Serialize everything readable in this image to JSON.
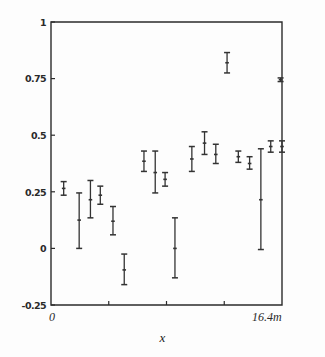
{
  "chart_data": {
    "type": "scatter",
    "title": "",
    "subtitle": "",
    "xlabel": "x",
    "ylabel": "",
    "grid": false,
    "legend": "none",
    "error_bars": "vertical",
    "xlim": [
      0,
      16.4
    ],
    "ylim": [
      -0.25,
      1.0
    ],
    "x_unit": "m",
    "xticks": [
      0,
      4.1,
      8.2,
      12.3,
      16.4
    ],
    "xtick_labels": [
      "0",
      "",
      "",
      "",
      "16.4m"
    ],
    "yticks": [
      -0.25,
      0,
      0.25,
      0.5,
      0.75,
      1
    ],
    "ytick_labels": [
      "-0.25",
      "0",
      "0.25",
      "0.5",
      "0.75",
      "1"
    ],
    "points": [
      {
        "x": 0.9,
        "y": 0.265,
        "yerr_low": 0.03,
        "yerr_high": 0.03
      },
      {
        "x": 2.0,
        "y": 0.125,
        "yerr_low": 0.125,
        "yerr_high": 0.12
      },
      {
        "x": 2.8,
        "y": 0.215,
        "yerr_low": 0.08,
        "yerr_high": 0.085
      },
      {
        "x": 3.5,
        "y": 0.235,
        "yerr_low": 0.04,
        "yerr_high": 0.04
      },
      {
        "x": 4.4,
        "y": 0.12,
        "yerr_low": 0.06,
        "yerr_high": 0.065
      },
      {
        "x": 5.2,
        "y": -0.095,
        "yerr_low": 0.065,
        "yerr_high": 0.07
      },
      {
        "x": 6.6,
        "y": 0.385,
        "yerr_low": 0.045,
        "yerr_high": 0.045
      },
      {
        "x": 7.4,
        "y": 0.335,
        "yerr_low": 0.09,
        "yerr_high": 0.095
      },
      {
        "x": 8.1,
        "y": 0.305,
        "yerr_low": 0.03,
        "yerr_high": 0.03
      },
      {
        "x": 8.8,
        "y": 0.0,
        "yerr_low": 0.13,
        "yerr_high": 0.135
      },
      {
        "x": 10.0,
        "y": 0.395,
        "yerr_low": 0.055,
        "yerr_high": 0.055
      },
      {
        "x": 10.9,
        "y": 0.465,
        "yerr_low": 0.05,
        "yerr_high": 0.05
      },
      {
        "x": 11.7,
        "y": 0.415,
        "yerr_low": 0.04,
        "yerr_high": 0.045
      },
      {
        "x": 12.5,
        "y": 0.82,
        "yerr_low": 0.045,
        "yerr_high": 0.045
      },
      {
        "x": 13.3,
        "y": 0.405,
        "yerr_low": 0.025,
        "yerr_high": 0.025
      },
      {
        "x": 14.1,
        "y": 0.375,
        "yerr_low": 0.025,
        "yerr_high": 0.03
      },
      {
        "x": 14.9,
        "y": 0.215,
        "yerr_low": 0.22,
        "yerr_high": 0.225
      },
      {
        "x": 15.6,
        "y": 0.45,
        "yerr_low": 0.025,
        "yerr_high": 0.025
      },
      {
        "x": 16.3,
        "y": 0.745,
        "yerr_low": 0.008,
        "yerr_high": 0.008
      },
      {
        "x": 16.4,
        "y": 0.45,
        "yerr_low": 0.025,
        "yerr_high": 0.025
      }
    ]
  },
  "axes": {
    "ytick_0": "1",
    "ytick_1": "0.75",
    "ytick_2": "0.5",
    "ytick_3": "0.25",
    "ytick_4": "0",
    "ytick_5": "-0.25",
    "xtick_left": "0",
    "xtick_right": "16.4m",
    "xaxis_title": "x"
  },
  "style": {
    "frame_color": "#2b2b2b",
    "marker_color": "#333333",
    "background": "#fdfdfd"
  }
}
